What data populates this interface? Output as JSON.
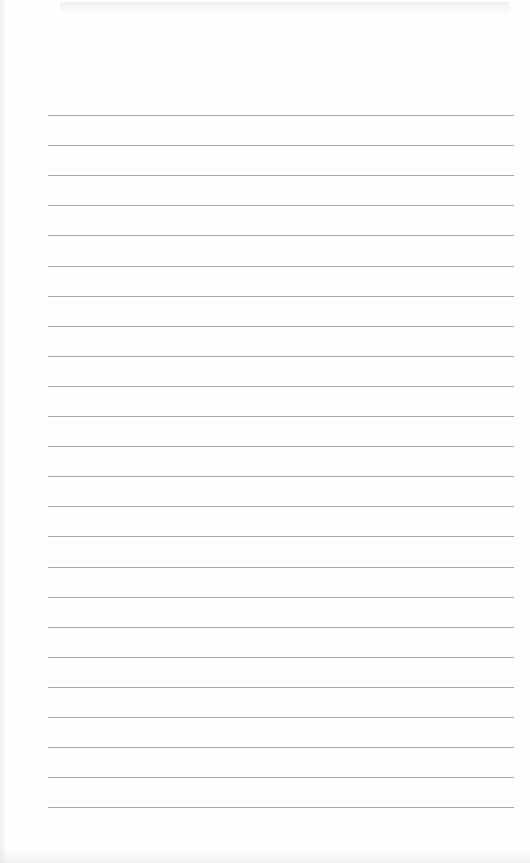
{
  "page": {
    "type": "blank lined paper",
    "background_color": "#fefefe",
    "rule_color": "#9a9a9a",
    "rule_count": 24,
    "rule_start_y": 115,
    "rule_spacing": 30.1,
    "rule_left_x": 48,
    "rule_right_x": 514
  }
}
